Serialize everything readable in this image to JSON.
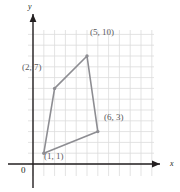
{
  "figure": {
    "kind": "coordinate-plane-quadrilateral",
    "axes": {
      "x_label": "x",
      "y_label": "y",
      "origin_label": "0"
    },
    "colors": {
      "grid": "#dcdcdc",
      "axis": "#231f20",
      "shape_stroke": "#8d8d92",
      "shape_fill": "none",
      "vertex": "#8d8d92",
      "label_text": "#5a5a5e",
      "axis_text": "#231f20",
      "background": "#ffffff"
    },
    "grid": {
      "show": true,
      "x_min": 0,
      "x_max": 11,
      "y_min": 0,
      "y_max": 12,
      "spacing_units": 1
    },
    "vertices": [
      {
        "id": "p0",
        "x": 1,
        "y": 1,
        "label": "(1, 1)"
      },
      {
        "id": "p1",
        "x": 2,
        "y": 7,
        "label": "(2, 7)"
      },
      {
        "id": "p2",
        "x": 5,
        "y": 10,
        "label": "(5, 10)"
      },
      {
        "id": "p3",
        "x": 6,
        "y": 3,
        "label": "(6, 3)"
      }
    ]
  }
}
